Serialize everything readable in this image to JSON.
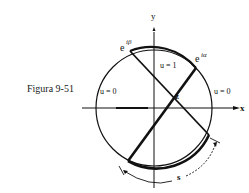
{
  "caption": "Figura 9-51",
  "axes": {
    "x_label": "x",
    "y_label": "y"
  },
  "points": {
    "beta_base": "e",
    "beta_exp": "iβ",
    "alpha_base": "e",
    "alpha_exp": "iα",
    "z": "z"
  },
  "regions": {
    "inner": "u = 1",
    "left": "u = 0",
    "right": "u = 0"
  },
  "arc_label": "s",
  "colors": {
    "ink": "#111111",
    "background": "#ffffff"
  }
}
